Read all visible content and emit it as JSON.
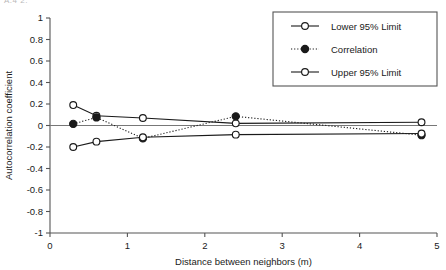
{
  "page": {
    "top_cut_text": "A.4 2."
  },
  "chart_data": {
    "type": "line",
    "title": "",
    "xlabel": "Distance between neighbors (m)",
    "ylabel": "Autocorrelation coefficient",
    "xlim": [
      0,
      5
    ],
    "ylim": [
      -1,
      1
    ],
    "xticks": [
      0,
      1,
      2,
      3,
      4,
      5
    ],
    "xtick_labels": [
      "0",
      "1",
      "2",
      "3",
      "4",
      "5"
    ],
    "yticks": [
      -1,
      -0.8,
      -0.6,
      -0.4,
      -0.2,
      0,
      0.2,
      0.4,
      0.6,
      0.8,
      1
    ],
    "ytick_labels": [
      "-1",
      "-0.8",
      "-0.6",
      "-0.4",
      "-0.2",
      "0",
      "0.2",
      "0.4",
      "0.6",
      "0.8",
      "1"
    ],
    "grid": false,
    "zero_line": true,
    "legend_position": "top-right",
    "x": [
      0.3,
      0.6,
      1.2,
      2.4,
      4.8
    ],
    "series": [
      {
        "name": "Lower 95% Limit",
        "marker": "open-circle",
        "line": "solid",
        "color": "#1a1a1a",
        "values": [
          0.19,
          0.09,
          0.07,
          0.02,
          0.03
        ]
      },
      {
        "name": "Correlation",
        "marker": "filled-circle",
        "line": "dotted",
        "color": "#1a1a1a",
        "values": [
          0.015,
          0.075,
          -0.12,
          0.085,
          -0.09
        ]
      },
      {
        "name": "Upper 95% Limit",
        "marker": "open-circle",
        "line": "solid",
        "color": "#1a1a1a",
        "values": [
          -0.2,
          -0.15,
          -0.11,
          -0.085,
          -0.075
        ]
      }
    ]
  },
  "legend": {
    "entries": [
      {
        "label": "Lower 95% Limit"
      },
      {
        "label": "Correlation"
      },
      {
        "label": "Upper 95% Limit"
      }
    ]
  }
}
